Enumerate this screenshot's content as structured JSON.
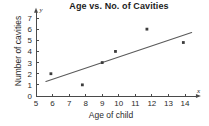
{
  "chart_data": {
    "type": "scatter",
    "title": "Age vs. No. of Cavities",
    "xlabel": "Age of child",
    "ylabel": "Number of cavities",
    "xlim": [
      5,
      14.6
    ],
    "ylim": [
      0,
      7.3
    ],
    "grid": false,
    "legend": null,
    "x_axis_symbol": "x",
    "y_axis_symbol": "y",
    "x_ticks": [
      5,
      6,
      7,
      8,
      9,
      10,
      11,
      12,
      13,
      14
    ],
    "x_tick_labels": [
      "5",
      "6",
      "7",
      "8",
      "9",
      "10",
      "11",
      "12",
      "13",
      "14"
    ],
    "y_ticks": [
      0,
      1,
      2,
      3,
      4,
      5,
      6,
      7
    ],
    "y_tick_labels": [
      "0",
      "1",
      "2",
      "3",
      "4",
      "5",
      "6",
      "7"
    ],
    "points": [
      {
        "x": 5.9,
        "y": 2.0
      },
      {
        "x": 7.8,
        "y": 1.0
      },
      {
        "x": 9.0,
        "y": 3.0
      },
      {
        "x": 9.8,
        "y": 4.0
      },
      {
        "x": 11.7,
        "y": 6.0
      },
      {
        "x": 13.9,
        "y": 4.8
      }
    ],
    "trend_line": {
      "x_start": 5.6,
      "y_start": 1.3,
      "x_end": 14.4,
      "y_end": 5.7
    },
    "colors": {
      "point": "#3c3c3c",
      "trend": "#5a5a5a",
      "axis": "#4a4a4a",
      "text": "#2b2b2b",
      "background": "#ffffff"
    }
  }
}
